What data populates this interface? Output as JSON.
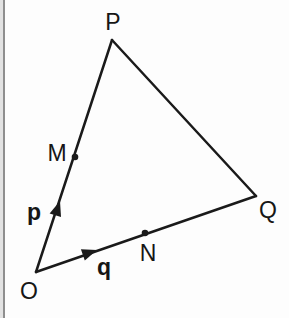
{
  "diagram": {
    "colors": {
      "line": "#1a1a1a",
      "label": "#161616",
      "background": "#fdfdfd",
      "border_light": "#e2e2e2",
      "border_dark": "#8e8e8e"
    },
    "stroke_width": 2.5,
    "dot_radius": 3.3,
    "arrowhead": {
      "length": 15,
      "half_width": 6
    },
    "points": {
      "O": {
        "x": 36,
        "y": 272
      },
      "P": {
        "x": 112,
        "y": 40
      },
      "Q": {
        "x": 256,
        "y": 196
      },
      "M": {
        "x": 75,
        "y": 157,
        "dot": true
      },
      "N": {
        "x": 145,
        "y": 233,
        "dot": true
      }
    },
    "edges": [
      {
        "from": "O",
        "to": "P"
      },
      {
        "from": "P",
        "to": "Q"
      },
      {
        "from": "O",
        "to": "Q"
      }
    ],
    "arrows": [
      {
        "vector": "p",
        "from": "O",
        "toward": "P",
        "tip": {
          "x": 60,
          "y": 201
        }
      },
      {
        "vector": "q",
        "from": "O",
        "toward": "Q",
        "tip": {
          "x": 97,
          "y": 250
        }
      }
    ],
    "labels": [
      {
        "text": "P",
        "x": 113,
        "y": 22
      },
      {
        "text": "Q",
        "x": 268,
        "y": 210
      },
      {
        "text": "O",
        "x": 29,
        "y": 291
      },
      {
        "text": "M",
        "x": 57,
        "y": 153
      },
      {
        "text": "N",
        "x": 148,
        "y": 253
      },
      {
        "text": "p",
        "x": 34,
        "y": 212,
        "bold": true
      },
      {
        "text": "q",
        "x": 104,
        "y": 267,
        "bold": true
      }
    ]
  }
}
